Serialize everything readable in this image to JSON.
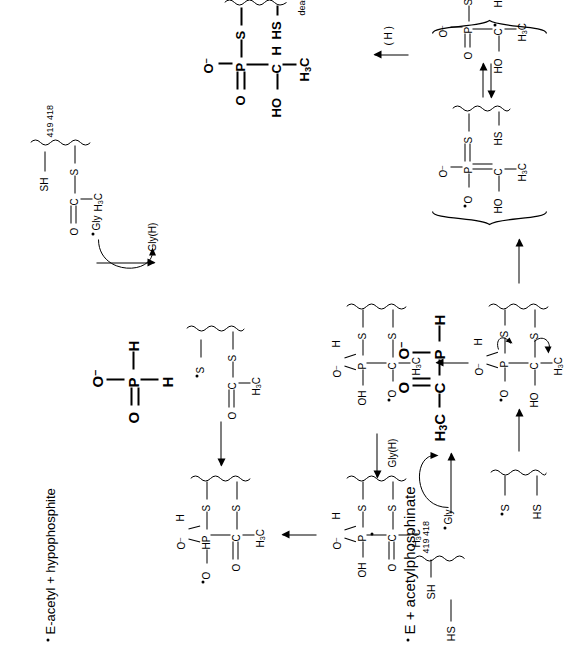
{
  "figure": {
    "type": "chemical-reaction-mechanism",
    "orientation_deg": -90
  },
  "labels": {
    "entry_bottom": "E  +  acetylphosphinate",
    "entry_top": "E-acetyl  +  hypophosphite",
    "gly_radical": "Gly",
    "gly_h": "Gly(H)",
    "h_transfer": "( H )",
    "dead_end": "dead-end product",
    "residues_419": "419",
    "residues_418": "418",
    "residues_pair": "419  418"
  },
  "atoms": {
    "O": "O",
    "O_minus": "O",
    "minus": "–",
    "P": "P",
    "H": "H",
    "S": "S",
    "C": "C",
    "HS": "HS",
    "SH": "SH",
    "HO": "HO",
    "OH": "OH",
    "HP": "HP",
    "CH3": "H3C",
    "CH3_pre": "H",
    "CH3_sub": "3",
    "CH3_post": "C"
  },
  "structures": [
    {
      "id": "enzyme-dithiol",
      "name": "free enzyme active-site dithiol",
      "position": "bottom-left",
      "parts": [
        "HS",
        "SH",
        "419",
        "418"
      ]
    },
    {
      "id": "acetylphosphinate",
      "name": "acetylphosphinate substrate (bold)",
      "position": "bottom-center-left",
      "bold": true,
      "parts": [
        "H3C",
        "C",
        "O",
        "P",
        "O",
        "H"
      ]
    },
    {
      "id": "thiyl-radical-enzyme",
      "name": "enzyme thiyl radical",
      "position": "bottom-left-mid",
      "parts": [
        "S",
        "HS"
      ]
    },
    {
      "id": "tetrahedral-adduct",
      "name": "tetrahedral radical adduct with electron-pushing arrows",
      "position": "bottom-center",
      "parts": [
        "O",
        "O",
        "P",
        "H",
        "S",
        "HO",
        "C",
        "S",
        "H3C"
      ]
    },
    {
      "id": "resonance-upper",
      "name": "phosphorus-centred radical resonance form",
      "position": "right-mid",
      "parts": [
        "O",
        "O",
        "P",
        "S",
        "HO",
        "C",
        "HS",
        "H3C"
      ]
    },
    {
      "id": "resonance-lower",
      "name": "oxygen-centred radical resonance form",
      "position": "right-lower",
      "parts": [
        "O",
        "O",
        "P",
        "S",
        "HO",
        "C",
        "HS",
        "H3C"
      ]
    },
    {
      "id": "dead-end-product",
      "name": "dead-end product",
      "position": "right-top",
      "bold": true,
      "parts": [
        "O",
        "O",
        "P",
        "S",
        "HO",
        "C",
        "H",
        "HS",
        "H3C",
        "419",
        "418"
      ]
    },
    {
      "id": "intermediate-oh",
      "name": "hydroxy phosphorane intermediate (left)",
      "position": "left-mid",
      "parts": [
        "OH",
        "O",
        "P",
        "H",
        "S",
        "O",
        "C",
        "S",
        "H3C"
      ]
    },
    {
      "id": "intermediate-oh-2",
      "name": "hydroxy phosphorane intermediate (center)",
      "position": "center-mid",
      "parts": [
        "OH",
        "O",
        "P",
        "H",
        "S",
        "O",
        "C",
        "S",
        "H3C"
      ]
    },
    {
      "id": "hp-adduct",
      "name": "HP adduct en route to hypophosphite release",
      "position": "left-upper",
      "parts": [
        "O",
        "O",
        "HP",
        "H",
        "S",
        "O",
        "C",
        "S",
        "H3C"
      ]
    },
    {
      "id": "acetyl-enzyme-thiyl",
      "name": "acetyl-enzyme with thiyl radical",
      "position": "center-upper",
      "parts": [
        "O",
        "C",
        "S",
        "S",
        "H3C"
      ]
    },
    {
      "id": "hypophosphite",
      "name": "hypophosphite product (bold)",
      "position": "top-center",
      "bold": true,
      "parts": [
        "O",
        "P",
        "O",
        "H",
        "H"
      ]
    },
    {
      "id": "acetyl-enzyme",
      "name": "acetyl-enzyme product",
      "position": "top-right",
      "parts": [
        "O",
        "C",
        "S",
        "SH",
        "H3C",
        "419",
        "418"
      ]
    }
  ],
  "arrows": [
    {
      "id": "a1",
      "kind": "reaction",
      "from": "acetylphosphinate",
      "to": "tetrahedral-adduct"
    },
    {
      "id": "a2",
      "kind": "reaction",
      "from": "tetrahedral-adduct",
      "to": "resonance-bracket"
    },
    {
      "id": "a3",
      "kind": "equilibrium",
      "between": [
        "resonance-lower",
        "resonance-upper"
      ]
    },
    {
      "id": "a4",
      "kind": "reaction",
      "from": "resonance-upper",
      "to": "dead-end-product",
      "label": "( H )"
    },
    {
      "id": "a5",
      "kind": "reaction",
      "from": "tetrahedral-adduct",
      "to": "intermediate-oh-2"
    },
    {
      "id": "a6",
      "kind": "reaction",
      "from": "intermediate-oh-2",
      "to": "intermediate-oh"
    },
    {
      "id": "a7",
      "kind": "reaction",
      "from": "intermediate-oh",
      "to": "hp-adduct"
    },
    {
      "id": "a8",
      "kind": "reaction",
      "from": "hp-adduct",
      "to": "acetyl-enzyme-thiyl"
    },
    {
      "id": "a9",
      "kind": "reaction",
      "from": "acetyl-enzyme-thiyl",
      "to": "acetyl-enzyme",
      "curved_in": "Gly",
      "curved_out": "Gly(H)"
    },
    {
      "id": "a10",
      "kind": "reaction",
      "from": "enzyme-dithiol",
      "to": "thiyl-radical-enzyme",
      "curved_in": "Gly",
      "curved_out": "Gly(H)"
    }
  ],
  "colors": {
    "ink": "#000000",
    "background": "#ffffff"
  }
}
